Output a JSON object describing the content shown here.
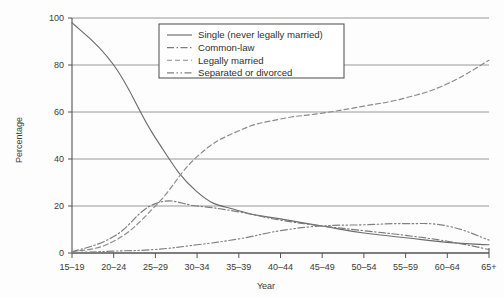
{
  "chart_data": {
    "type": "line",
    "title": "",
    "xlabel": "Year",
    "ylabel": "Percentage",
    "categories": [
      "15–19",
      "20–24",
      "25–29",
      "30–34",
      "35–39",
      "40–44",
      "45–49",
      "50–54",
      "55–59",
      "60–64",
      "65+"
    ],
    "ylim": [
      0,
      100
    ],
    "yticks": [
      0,
      20,
      40,
      60,
      80,
      100
    ],
    "grid": "horizontal",
    "legend_position": "top-center",
    "series": [
      {
        "name": "Single (never legally married)",
        "style": "solid",
        "color": "#6b6b6b",
        "values": [
          98,
          80,
          49,
          26,
          18,
          14.5,
          11.5,
          8.5,
          6.5,
          4.5,
          3.5
        ]
      },
      {
        "name": "Common-law",
        "style": "dash-dot",
        "color": "#7a7a7a",
        "values": [
          0.5,
          7,
          21,
          20,
          17.5,
          14,
          11.5,
          9.5,
          7.5,
          5,
          1.5
        ]
      },
      {
        "name": "Legally married",
        "style": "dashed",
        "color": "#8a8a8a",
        "values": [
          0.5,
          5,
          20,
          41,
          52,
          57,
          59.5,
          62.5,
          66,
          72,
          82
        ]
      },
      {
        "name": "Separated or divorced",
        "style": "dash-dot-dot",
        "color": "#808080",
        "values": [
          0.2,
          0.8,
          1.5,
          3.5,
          6,
          9.5,
          11.5,
          12,
          12.5,
          11.5,
          5.5
        ]
      }
    ]
  },
  "axes": {
    "y_tick_labels": [
      "0",
      "20",
      "40",
      "60",
      "80",
      "100"
    ],
    "x_tick_labels": [
      "15–19",
      "20–24",
      "25–29",
      "30–34",
      "35–39",
      "40–44",
      "45–49",
      "50–54",
      "55–59",
      "60–64",
      "65+"
    ],
    "y_axis_title": "Percentage",
    "x_axis_title": "Year"
  },
  "legend": {
    "entries": [
      {
        "label": "Single (never legally married)"
      },
      {
        "label": "Common-law"
      },
      {
        "label": "Legally married"
      },
      {
        "label": "Separated or divorced"
      }
    ]
  }
}
